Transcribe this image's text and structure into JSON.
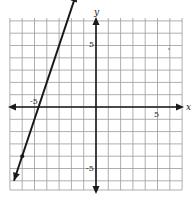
{
  "chart_data": {
    "type": "line",
    "title": "",
    "xlabel": "x",
    "ylabel": "y",
    "xlim": [
      -7,
      7
    ],
    "ylim": [
      -7,
      7
    ],
    "grid": true,
    "grid_step": 1,
    "x_tick_labels": [
      {
        "value": -5,
        "label": "-5"
      },
      {
        "value": 5,
        "label": "5"
      }
    ],
    "y_tick_labels": [
      {
        "value": 5,
        "label": "5"
      },
      {
        "value": -5,
        "label": "-5"
      }
    ],
    "series": [
      {
        "name": "line",
        "equation": "y = 3x + 14",
        "slope": 3,
        "intercept": 14,
        "x": [
          -6.67,
          -1.6
        ],
        "y": [
          -6.0,
          9.2
        ],
        "arrows": "both",
        "marked_points": [
          {
            "x": -6,
            "y": -4
          }
        ]
      }
    ],
    "legend": null
  },
  "labels": {
    "x_axis": "x",
    "y_axis": "y",
    "x_neg5": "-5",
    "x_pos5": "5",
    "y_pos5": "5",
    "y_neg5": "-5"
  },
  "colors": {
    "grid": "#9a9a9a",
    "axis": "#1a1a1a",
    "line": "#1a1a1a",
    "background": "#ffffff"
  }
}
